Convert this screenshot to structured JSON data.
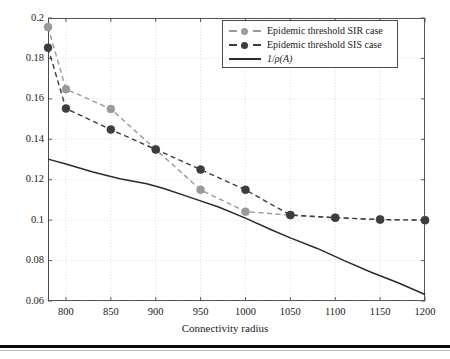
{
  "figure": {
    "background_color": "#ffffff",
    "frame_color": "#4a4a4a",
    "grid_color": "#c9c9c9"
  },
  "axes": {
    "xlabel": "Connectivity radius",
    "ylabel": "",
    "x_ticks": [
      800,
      850,
      900,
      950,
      1000,
      1050,
      1100,
      1150,
      1200
    ],
    "x_tick_labels": [
      "800",
      "850",
      "900",
      "950",
      "1000",
      "1050",
      "1100",
      "1150",
      "1200"
    ],
    "y_ticks": [
      0.06,
      0.08,
      0.1,
      0.12,
      0.14,
      0.16,
      0.18,
      0.2
    ],
    "y_tick_labels": [
      "0.06",
      "0.08",
      "0.1",
      "0.12",
      "0.14",
      "0.16",
      "0.18",
      "0.2"
    ],
    "xlim": [
      780,
      1200
    ],
    "ylim": [
      0.06,
      0.2
    ],
    "grid": "dotted-both"
  },
  "legend": {
    "position": "top-right",
    "entries": [
      {
        "label": "Epidemic threshold SIR case",
        "style": "dashed-marker",
        "color": "#999999"
      },
      {
        "label": "Epidemic threshold SIS case",
        "style": "dashed-marker",
        "color": "#3d3d3d"
      },
      {
        "label": "1/ρ(A)",
        "style": "solid",
        "color": "#2b2b2b"
      }
    ]
  },
  "chart_data": {
    "type": "line",
    "title": "",
    "subtitle": "",
    "xlabel": "Connectivity radius",
    "ylabel": "",
    "xlim": [
      780,
      1200
    ],
    "ylim": [
      0.06,
      0.2
    ],
    "grid": true,
    "legend_position": "top-right",
    "x": [
      780,
      800,
      850,
      900,
      950,
      1000,
      1050,
      1100,
      1150,
      1200
    ],
    "series": [
      {
        "name": "Epidemic threshold SIR case",
        "color": "#999999",
        "linestyle": "dashed",
        "marker": "circle",
        "values": [
          0.1955,
          0.1648,
          0.155,
          0.135,
          0.115,
          0.1042,
          0.1025,
          0.1012,
          0.1003,
          0.1
        ]
      },
      {
        "name": "Epidemic threshold SIS case",
        "color": "#3d3d3d",
        "linestyle": "dashed",
        "marker": "circle",
        "values": [
          0.1853,
          0.1552,
          0.1448,
          0.135,
          0.125,
          0.115,
          0.1025,
          0.1012,
          0.1003,
          0.1
        ]
      },
      {
        "name": "1/ρ(A)",
        "color": "#2b2b2b",
        "linestyle": "solid",
        "marker": "none",
        "x": [
          780,
          800,
          830,
          860,
          890,
          910,
          940,
          970,
          1000,
          1030,
          1050,
          1080,
          1110,
          1140,
          1170,
          1200
        ],
        "values": [
          0.1302,
          0.1278,
          0.1238,
          0.1205,
          0.118,
          0.1155,
          0.111,
          0.1065,
          0.101,
          0.095,
          0.0912,
          0.086,
          0.08,
          0.0742,
          0.069,
          0.0632
        ]
      }
    ]
  }
}
